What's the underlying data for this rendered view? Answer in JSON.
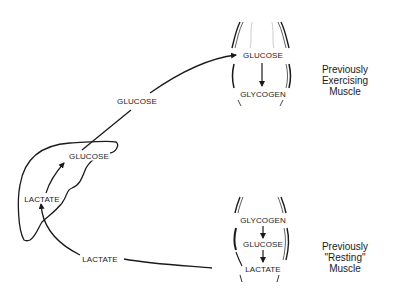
{
  "diagram": {
    "type": "metabolic-pathway",
    "colors": {
      "line": "#1a1a1a",
      "background": "#ffffff",
      "faint": "#9a9a9a"
    },
    "upper_muscle": {
      "metabolites": [
        "GLUCOSE",
        "GLYCOGEN"
      ],
      "caption_line1": "Previously Exercising",
      "caption_line2": "Muscle"
    },
    "lower_muscle": {
      "metabolites": [
        "GLYCOGEN",
        "GLUCOSE",
        "LACTATE"
      ],
      "caption_line1": "Previously \"Resting\"",
      "caption_line2": "Muscle"
    },
    "liver": {
      "metabolites": [
        "GLUCOSE",
        "LACTATE"
      ]
    },
    "transport": {
      "liver_to_muscle": "GLUCOSE",
      "muscle_to_liver": "LACTATE"
    }
  }
}
